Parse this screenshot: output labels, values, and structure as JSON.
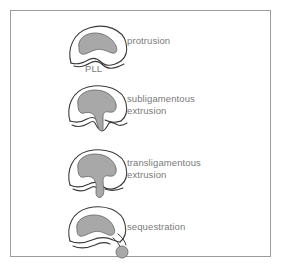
{
  "figure": {
    "frame": {
      "border_color": "#9b9b9b",
      "background": "#ffffff"
    },
    "style": {
      "outline_color": "#3a3a3a",
      "disc_fill": "#a8a8a8",
      "disc_stroke": "#6e6e6e",
      "text_color": "#7a7a7a"
    },
    "annotations": {
      "pll": "PLL"
    },
    "rows": [
      {
        "id": "protrusion",
        "label": "protrusion",
        "diagram_name": "disc-protrusion-diagram"
      },
      {
        "id": "subligamentous-extrusion",
        "label": "subligamentous\nextrusion",
        "diagram_name": "disc-subligamentous-extrusion-diagram"
      },
      {
        "id": "transligamentous-extrusion",
        "label": "transligamentous\nextrusion",
        "diagram_name": "disc-transligamentous-extrusion-diagram"
      },
      {
        "id": "sequestration",
        "label": "sequestration",
        "diagram_name": "disc-sequestration-diagram"
      }
    ]
  }
}
